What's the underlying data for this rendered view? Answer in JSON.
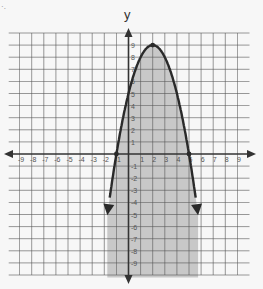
{
  "corner_mark": "·.",
  "chart_data": {
    "type": "line",
    "title": "",
    "xlabel": "",
    "ylabel": "y",
    "xlim": [
      -10,
      10
    ],
    "ylim": [
      -10,
      10
    ],
    "grid": true,
    "x_ticks": [
      -9,
      -8,
      -7,
      -6,
      -5,
      -4,
      -3,
      -2,
      -1,
      1,
      2,
      3,
      4,
      5,
      6,
      7,
      8,
      9
    ],
    "y_ticks": [
      9,
      8,
      7,
      6,
      5,
      4,
      3,
      2,
      1,
      -1,
      -2,
      -3,
      -4,
      -5,
      -6,
      -7,
      -8,
      -9
    ],
    "series": [
      {
        "name": "parabola",
        "equation": "y = -(x - 2)^2 + 9",
        "vertex": [
          2,
          9
        ],
        "roots": [
          -1,
          5
        ],
        "y_intercept": 5,
        "shaded": "inside (below curve)",
        "line_style": "solid",
        "arrows": true
      }
    ],
    "points": [
      {
        "x": -1,
        "y": 0
      },
      {
        "x": 5,
        "y": 0
      },
      {
        "x": 2,
        "y": 9
      }
    ],
    "colors": {
      "curve": "#2a2a2a",
      "shade": "#c8c8c8",
      "grid": "#555555",
      "background": "#f7f7f7"
    }
  }
}
